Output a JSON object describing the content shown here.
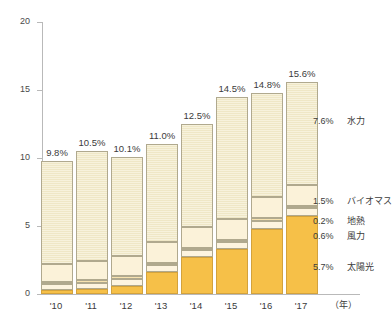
{
  "chart_data": {
    "type": "bar",
    "title": "",
    "subtitle": "",
    "xlabel": "(年)",
    "ylabel": "",
    "ylim": [
      0,
      20
    ],
    "yticks": [
      0,
      5,
      10,
      15,
      20
    ],
    "ytick_labels": [
      "0",
      "5",
      "10",
      "15",
      "20"
    ],
    "grid": false,
    "legend_position": "right-inline",
    "stacked": true,
    "categories": [
      "'10",
      "'11",
      "'12",
      "'13",
      "'14",
      "'15",
      "'16",
      "'17"
    ],
    "totals": [
      9.8,
      10.5,
      10.1,
      11.0,
      12.5,
      14.5,
      14.8,
      15.6
    ],
    "total_labels": [
      "9.8%",
      "10.5%",
      "10.1%",
      "11.0%",
      "12.5%",
      "14.5%",
      "14.8%",
      "15.6%"
    ],
    "series": [
      {
        "name": "太陽光",
        "color": "#f6c048",
        "values": [
          0.3,
          0.4,
          0.6,
          1.6,
          2.7,
          3.3,
          4.8,
          5.7
        ]
      },
      {
        "name": "風力",
        "color": "#fdf4df",
        "values": [
          0.4,
          0.4,
          0.5,
          0.5,
          0.5,
          0.5,
          0.6,
          0.6
        ]
      },
      {
        "name": "地熱",
        "color": "#f7e3b0",
        "values": [
          0.2,
          0.2,
          0.2,
          0.2,
          0.2,
          0.2,
          0.2,
          0.2
        ]
      },
      {
        "name": "バイオマス",
        "color": "#fbf2d9",
        "values": [
          1.3,
          1.4,
          1.5,
          1.5,
          1.5,
          1.5,
          1.5,
          1.5
        ]
      },
      {
        "name": "水力",
        "color": "#f3ecd2",
        "values": [
          7.6,
          8.1,
          7.3,
          7.2,
          7.6,
          9.0,
          7.7,
          7.6
        ]
      }
    ],
    "callouts": [
      {
        "pct": "7.6%",
        "name": "水力"
      },
      {
        "pct": "1.5%",
        "name": "バイオマス"
      },
      {
        "pct": "0.2%",
        "name": "地熱"
      },
      {
        "pct": "0.6%",
        "name": "風力"
      },
      {
        "pct": "5.7%",
        "name": "太陽光"
      }
    ]
  },
  "axis": {
    "y_labels": [
      "20",
      "15",
      "10",
      "5",
      "0"
    ],
    "x_labels": [
      "'10",
      "'11",
      "'12",
      "'13",
      "'14",
      "'15",
      "'16",
      "'17"
    ],
    "x_unit": "（年）"
  },
  "colors": {
    "solar": "#f6c048",
    "wind": "#fdf4df",
    "geothermal": "#f7e3b0",
    "biomass": "#fbf2d9",
    "hydro": "#f3ecd2",
    "axis": "#b9b9b9",
    "text": "#3b3b3b"
  }
}
